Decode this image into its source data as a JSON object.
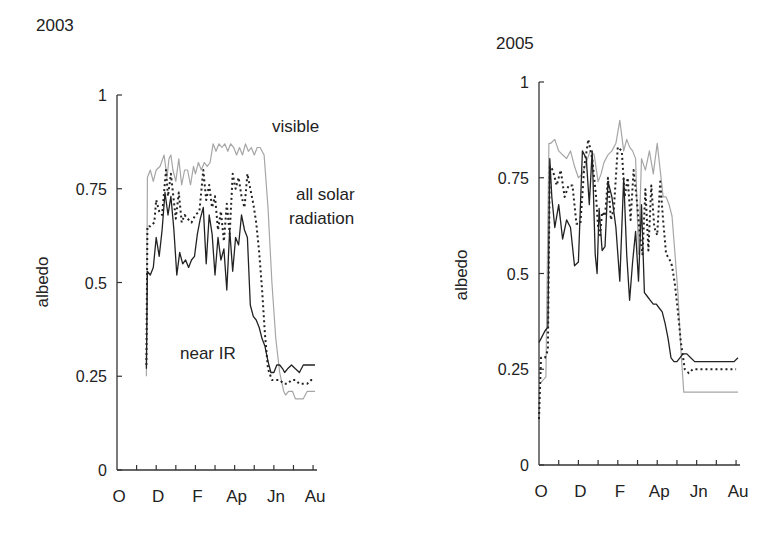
{
  "figure": {
    "panels": [
      {
        "year_label": "2003"
      },
      {
        "year_label": "2005"
      }
    ],
    "annotations": {
      "visible": "visible",
      "all_solar_line1": "all solar",
      "all_solar_line2": "radiation",
      "near_ir": "near IR"
    },
    "colors": {
      "visible": "#a6a6a6",
      "all_solar": "#222222",
      "near_ir": "#222222",
      "axis": "#333333"
    }
  },
  "chart_data": [
    {
      "type": "line",
      "title": "2003",
      "xlabel": "",
      "ylabel": "albedo",
      "ylim": [
        0,
        1
      ],
      "xlim": [
        0,
        10.2
      ],
      "x_unit": "months since 1 October",
      "yticks": [
        0,
        0.25,
        0.5,
        0.75,
        1
      ],
      "ytick_labels": [
        "0",
        "0.25",
        "0.5",
        "0.75",
        "1"
      ],
      "xtick_positions": [
        0,
        1,
        2,
        3,
        4,
        5,
        6,
        7,
        8,
        9,
        10
      ],
      "xtick_labels": [
        {
          "pos": 0,
          "label": "O"
        },
        {
          "pos": 2,
          "label": "D"
        },
        {
          "pos": 4,
          "label": "F"
        },
        {
          "pos": 6,
          "label": "Ap"
        },
        {
          "pos": 8,
          "label": "Jn"
        },
        {
          "pos": 10,
          "label": "Au"
        }
      ],
      "grid": false,
      "legend": "inline annotations",
      "series": [
        {
          "name": "visible",
          "style": "solid-gray",
          "x": [
            1.5,
            1.55,
            1.7,
            1.85,
            2.0,
            2.2,
            2.4,
            2.55,
            2.65,
            2.75,
            2.85,
            3.0,
            3.15,
            3.3,
            3.45,
            3.6,
            3.75,
            3.9,
            4.0,
            4.15,
            4.3,
            4.45,
            4.6,
            4.75,
            4.9,
            5.05,
            5.2,
            5.35,
            5.5,
            5.65,
            5.8,
            5.95,
            6.1,
            6.25,
            6.4,
            6.55,
            6.7,
            6.85,
            7.0,
            7.15,
            7.3,
            7.5,
            7.7,
            7.9,
            8.1,
            8.3,
            8.5,
            8.6,
            8.75,
            8.95,
            9.1,
            9.3,
            9.5,
            9.7,
            9.9,
            10.1
          ],
          "y": [
            0.25,
            0.78,
            0.8,
            0.77,
            0.8,
            0.81,
            0.84,
            0.78,
            0.83,
            0.84,
            0.8,
            0.77,
            0.83,
            0.76,
            0.8,
            0.8,
            0.76,
            0.81,
            0.79,
            0.82,
            0.8,
            0.82,
            0.81,
            0.82,
            0.87,
            0.85,
            0.87,
            0.86,
            0.87,
            0.85,
            0.87,
            0.86,
            0.84,
            0.86,
            0.84,
            0.87,
            0.85,
            0.86,
            0.84,
            0.86,
            0.86,
            0.84,
            0.7,
            0.5,
            0.35,
            0.26,
            0.21,
            0.2,
            0.21,
            0.21,
            0.19,
            0.19,
            0.19,
            0.21,
            0.21,
            0.21
          ]
        },
        {
          "name": "all solar radiation",
          "style": "dotted-black",
          "x": [
            1.5,
            1.55,
            1.7,
            1.9,
            2.0,
            2.15,
            2.3,
            2.5,
            2.6,
            2.75,
            2.85,
            3.0,
            3.15,
            3.3,
            3.45,
            3.6,
            3.8,
            4.0,
            4.2,
            4.4,
            4.55,
            4.7,
            4.85,
            5.0,
            5.15,
            5.3,
            5.45,
            5.6,
            5.75,
            5.9,
            6.05,
            6.2,
            6.35,
            6.5,
            6.65,
            6.8,
            6.95,
            7.1,
            7.25,
            7.4,
            7.55,
            7.7,
            7.9,
            8.1,
            8.3,
            8.5,
            8.7,
            8.9,
            9.1,
            9.3,
            9.5,
            9.7,
            9.9,
            10.1
          ],
          "y": [
            0.28,
            0.65,
            0.65,
            0.66,
            0.72,
            0.69,
            0.68,
            0.8,
            0.73,
            0.79,
            0.74,
            0.67,
            0.74,
            0.66,
            0.68,
            0.67,
            0.66,
            0.68,
            0.69,
            0.8,
            0.72,
            0.76,
            0.7,
            0.73,
            0.64,
            0.69,
            0.61,
            0.71,
            0.63,
            0.79,
            0.75,
            0.78,
            0.73,
            0.7,
            0.79,
            0.75,
            0.71,
            0.66,
            0.58,
            0.48,
            0.36,
            0.27,
            0.24,
            0.24,
            0.24,
            0.23,
            0.23,
            0.24,
            0.24,
            0.23,
            0.23,
            0.23,
            0.24,
            0.24
          ]
        },
        {
          "name": "near IR",
          "style": "solid-black",
          "x": [
            1.5,
            1.55,
            1.7,
            1.85,
            2.0,
            2.15,
            2.3,
            2.45,
            2.6,
            2.75,
            2.9,
            3.05,
            3.2,
            3.35,
            3.5,
            3.65,
            3.8,
            3.95,
            4.1,
            4.25,
            4.4,
            4.55,
            4.7,
            4.85,
            5.0,
            5.15,
            5.3,
            5.45,
            5.6,
            5.75,
            5.9,
            6.05,
            6.2,
            6.35,
            6.5,
            6.65,
            6.8,
            6.95,
            7.1,
            7.25,
            7.4,
            7.55,
            7.7,
            7.85,
            8.0,
            8.15,
            8.3,
            8.45,
            8.55,
            8.7,
            8.9,
            9.1,
            9.3,
            9.5,
            9.7,
            9.9,
            10.1
          ],
          "y": [
            0.27,
            0.53,
            0.52,
            0.54,
            0.62,
            0.57,
            0.64,
            0.74,
            0.68,
            0.73,
            0.64,
            0.52,
            0.58,
            0.55,
            0.56,
            0.54,
            0.56,
            0.57,
            0.63,
            0.67,
            0.7,
            0.55,
            0.68,
            0.63,
            0.52,
            0.62,
            0.56,
            0.59,
            0.48,
            0.64,
            0.53,
            0.62,
            0.6,
            0.68,
            0.64,
            0.62,
            0.44,
            0.41,
            0.4,
            0.38,
            0.35,
            0.33,
            0.29,
            0.26,
            0.26,
            0.28,
            0.28,
            0.27,
            0.26,
            0.27,
            0.28,
            0.27,
            0.26,
            0.28,
            0.28,
            0.28,
            0.28
          ]
        }
      ]
    },
    {
      "type": "line",
      "title": "2005",
      "xlabel": "",
      "ylabel": "albedo",
      "ylim": [
        0,
        1
      ],
      "xlim": [
        0,
        10.2
      ],
      "x_unit": "months since 1 October",
      "yticks": [
        0,
        0.25,
        0.5,
        0.75,
        1
      ],
      "ytick_labels": [
        "0",
        "0.25",
        "0.5",
        "0.75",
        "1"
      ],
      "xtick_positions": [
        0,
        1,
        2,
        3,
        4,
        5,
        6,
        7,
        8,
        9,
        10
      ],
      "xtick_labels": [
        {
          "pos": 0,
          "label": "O"
        },
        {
          "pos": 2,
          "label": "D"
        },
        {
          "pos": 4,
          "label": "F"
        },
        {
          "pos": 6,
          "label": "Ap"
        },
        {
          "pos": 8,
          "label": "Jn"
        },
        {
          "pos": 10,
          "label": "Au"
        }
      ],
      "grid": false,
      "legend": "none",
      "series": [
        {
          "name": "visible",
          "style": "solid-gray",
          "x": [
            0.0,
            0.35,
            0.5,
            0.6,
            0.8,
            1.0,
            1.2,
            1.4,
            1.6,
            1.8,
            2.0,
            2.2,
            2.4,
            2.6,
            2.8,
            3.0,
            3.15,
            3.3,
            3.5,
            3.7,
            3.9,
            4.1,
            4.3,
            4.45,
            4.6,
            4.75,
            4.9,
            5.05,
            5.2,
            5.4,
            5.6,
            5.8,
            6.0,
            6.15,
            6.3,
            6.45,
            6.6,
            6.75,
            6.9,
            7.05,
            7.2,
            7.35,
            7.5,
            7.7,
            7.9,
            8.1,
            8.3,
            8.5,
            8.7,
            8.9,
            9.1,
            9.3,
            9.5,
            9.7,
            9.9,
            10.1
          ],
          "y": [
            0.21,
            0.23,
            0.84,
            0.84,
            0.85,
            0.82,
            0.81,
            0.8,
            0.82,
            0.78,
            0.75,
            0.76,
            0.79,
            0.82,
            0.81,
            0.74,
            0.76,
            0.79,
            0.81,
            0.82,
            0.84,
            0.9,
            0.82,
            0.85,
            0.83,
            0.82,
            0.8,
            0.55,
            0.8,
            0.77,
            0.82,
            0.76,
            0.84,
            0.77,
            0.7,
            0.7,
            0.68,
            0.65,
            0.55,
            0.45,
            0.3,
            0.19,
            0.19,
            0.19,
            0.19,
            0.19,
            0.19,
            0.19,
            0.19,
            0.19,
            0.19,
            0.19,
            0.19,
            0.19,
            0.19,
            0.19
          ]
        },
        {
          "name": "all solar radiation",
          "style": "dotted-black",
          "x": [
            0.0,
            0.1,
            0.3,
            0.45,
            0.55,
            0.7,
            0.9,
            1.1,
            1.3,
            1.5,
            1.7,
            1.9,
            2.1,
            2.3,
            2.5,
            2.7,
            2.9,
            3.0,
            3.1,
            3.2,
            3.35,
            3.5,
            3.65,
            3.8,
            4.0,
            4.2,
            4.35,
            4.5,
            4.65,
            4.8,
            4.95,
            5.1,
            5.25,
            5.4,
            5.55,
            5.7,
            5.85,
            6.0,
            6.15,
            6.3,
            6.45,
            6.6,
            6.75,
            6.9,
            7.05,
            7.2,
            7.4,
            7.6,
            7.8,
            8.0,
            8.2,
            8.4,
            8.6,
            8.8,
            9.0,
            9.3,
            9.6,
            10.0
          ],
          "y": [
            0.12,
            0.28,
            0.28,
            0.3,
            0.78,
            0.77,
            0.73,
            0.77,
            0.7,
            0.73,
            0.73,
            0.63,
            0.63,
            0.78,
            0.85,
            0.8,
            0.7,
            0.62,
            0.6,
            0.66,
            0.65,
            0.75,
            0.64,
            0.67,
            0.83,
            0.82,
            0.7,
            0.75,
            0.64,
            0.77,
            0.7,
            0.61,
            0.55,
            0.72,
            0.56,
            0.73,
            0.62,
            0.6,
            0.74,
            0.64,
            0.55,
            0.54,
            0.52,
            0.47,
            0.4,
            0.32,
            0.25,
            0.24,
            0.25,
            0.25,
            0.25,
            0.25,
            0.25,
            0.25,
            0.25,
            0.25,
            0.25,
            0.25
          ]
        },
        {
          "name": "near IR",
          "style": "solid-black",
          "x": [
            0.0,
            0.1,
            0.3,
            0.45,
            0.55,
            0.65,
            0.8,
            1.0,
            1.2,
            1.4,
            1.6,
            1.8,
            2.0,
            2.2,
            2.4,
            2.55,
            2.7,
            2.85,
            2.95,
            3.05,
            3.2,
            3.35,
            3.5,
            3.7,
            3.9,
            4.1,
            4.3,
            4.45,
            4.6,
            4.75,
            4.9,
            5.05,
            5.2,
            5.35,
            5.5,
            5.65,
            5.8,
            5.95,
            6.1,
            6.25,
            6.4,
            6.55,
            6.7,
            6.85,
            7.0,
            7.15,
            7.3,
            7.5,
            7.7,
            7.9,
            8.1,
            8.3,
            8.5,
            8.7,
            8.9,
            9.1,
            9.3,
            9.5,
            9.7,
            9.9,
            10.1
          ],
          "y": [
            0.32,
            0.33,
            0.35,
            0.36,
            0.8,
            0.7,
            0.62,
            0.68,
            0.59,
            0.64,
            0.62,
            0.52,
            0.53,
            0.82,
            0.8,
            0.68,
            0.82,
            0.55,
            0.5,
            0.67,
            0.56,
            0.57,
            0.74,
            0.7,
            0.62,
            0.48,
            0.75,
            0.55,
            0.43,
            0.53,
            0.61,
            0.48,
            0.68,
            0.45,
            0.44,
            0.43,
            0.42,
            0.42,
            0.41,
            0.4,
            0.37,
            0.33,
            0.28,
            0.27,
            0.27,
            0.28,
            0.29,
            0.29,
            0.28,
            0.27,
            0.27,
            0.27,
            0.27,
            0.27,
            0.27,
            0.27,
            0.27,
            0.27,
            0.27,
            0.27,
            0.28
          ]
        }
      ]
    }
  ]
}
